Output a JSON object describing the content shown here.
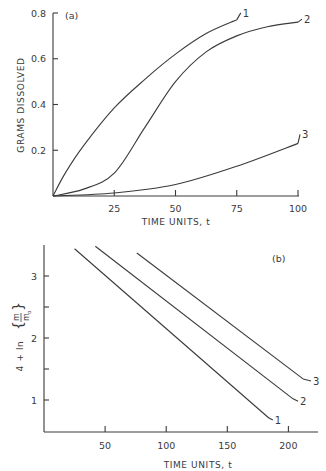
{
  "chart_data": [
    {
      "type": "line",
      "panel_label": "(a)",
      "title": "",
      "xlabel": "TIME UNITS, t",
      "ylabel": "GRAMS DISSOLVED",
      "xlim": [
        0,
        100
      ],
      "ylim": [
        0,
        0.8
      ],
      "xticks": [
        25,
        50,
        75,
        100
      ],
      "xtick_labels": [
        "25",
        "50",
        "75",
        "100"
      ],
      "yticks": [
        0.2,
        0.4,
        0.6,
        0.8
      ],
      "ytick_labels": [
        "0.2",
        "0.4",
        "0.6",
        "0.8"
      ],
      "grid": false,
      "legend": "inline labels at curve ends",
      "series": [
        {
          "name": "1",
          "x": [
            0,
            5,
            12.5,
            25,
            37.5,
            50,
            62.5,
            75
          ],
          "y": [
            0,
            0.1,
            0.22,
            0.385,
            0.51,
            0.62,
            0.71,
            0.77
          ]
        },
        {
          "name": "2",
          "x": [
            0,
            12.5,
            25,
            37.5,
            50,
            62.5,
            75,
            87.5,
            100
          ],
          "y": [
            0,
            0.03,
            0.1,
            0.3,
            0.5,
            0.63,
            0.7,
            0.74,
            0.76
          ]
        },
        {
          "name": "3",
          "x": [
            0,
            25,
            50,
            75,
            100
          ],
          "y": [
            0,
            0.013,
            0.05,
            0.13,
            0.23
          ]
        }
      ]
    },
    {
      "type": "line",
      "panel_label": "(b)",
      "title": "",
      "xlabel": "TIME UNITS, t",
      "ylabel": "4 + ln{m/m₀}",
      "ylabel_parts": {
        "prefix": "4 + ln",
        "numerator": "m",
        "denominator": "m",
        "subscript": "o"
      },
      "xlim": [
        0,
        225
      ],
      "ylim": [
        0.48,
        3.65
      ],
      "xticks": [
        50,
        100,
        150,
        200
      ],
      "xtick_labels": [
        "50",
        "100",
        "150",
        "200"
      ],
      "yticks": [
        1,
        1.5,
        2,
        2.5,
        3
      ],
      "ytick_labels": [
        "1",
        "",
        "2",
        "",
        "3"
      ],
      "grid": false,
      "legend": "inline labels at line ends",
      "series": [
        {
          "name": "1",
          "x": [
            25,
            184
          ],
          "y": [
            3.44,
            0.71
          ]
        },
        {
          "name": "2",
          "x": [
            42,
            203
          ],
          "y": [
            3.48,
            1.03
          ]
        },
        {
          "name": "3",
          "x": [
            76,
            212
          ],
          "y": [
            3.37,
            1.34
          ]
        }
      ]
    }
  ]
}
